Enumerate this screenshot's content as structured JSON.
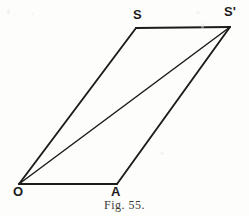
{
  "figure": {
    "caption": "Fig. 55.",
    "background_color": "#fdfdfb",
    "ink_color": "#1c1c1c",
    "labels": {
      "origin": "O",
      "point_a": "A",
      "point_s": "S",
      "point_s_prime": "S'"
    },
    "points": {
      "O": {
        "x": 19,
        "y": 184
      },
      "A": {
        "x": 117,
        "y": 184
      },
      "S": {
        "x": 136,
        "y": 28
      },
      "Sp": {
        "x": 230,
        "y": 27
      }
    },
    "segments": [
      {
        "name": "base-O-A",
        "from": "O",
        "to": "A",
        "width": 2.2
      },
      {
        "name": "side-O-S",
        "from": "O",
        "to": "S",
        "width": 1.9
      },
      {
        "name": "top-S-Sprime",
        "from": "S",
        "to": "Sp",
        "width": 2.2
      },
      {
        "name": "side-A-Sprime",
        "from": "A",
        "to": "Sp",
        "width": 1.9
      },
      {
        "name": "diagonal-O-Sprime",
        "from": "O",
        "to": "Sp",
        "width": 1.5
      }
    ]
  }
}
